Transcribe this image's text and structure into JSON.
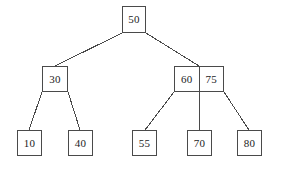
{
  "diagram": {
    "type": "tree-diagram",
    "background_color": "#ffffff",
    "line_color": "#4a4a4a",
    "text_color": "#1c1c1c",
    "canvas": {
      "width": 282,
      "height": 169
    },
    "nodes": [
      {
        "id": "root",
        "level": 0,
        "keys": [
          "50"
        ],
        "x": 122,
        "y": 6,
        "width": 24,
        "height": 27
      },
      {
        "id": "internal-left",
        "level": 1,
        "keys": [
          "30"
        ],
        "x": 42,
        "y": 66,
        "width": 26,
        "height": 26
      },
      {
        "id": "internal-right",
        "level": 1,
        "keys": [
          "60",
          "75"
        ],
        "x": 174,
        "y": 66,
        "width": 50,
        "height": 26
      },
      {
        "id": "leaf-10",
        "level": 2,
        "keys": [
          "10"
        ],
        "x": 17,
        "y": 130,
        "width": 25,
        "height": 26
      },
      {
        "id": "leaf-40",
        "level": 2,
        "keys": [
          "40"
        ],
        "x": 68,
        "y": 130,
        "width": 25,
        "height": 26
      },
      {
        "id": "leaf-55",
        "level": 2,
        "keys": [
          "55"
        ],
        "x": 132,
        "y": 130,
        "width": 25,
        "height": 26
      },
      {
        "id": "leaf-70",
        "level": 2,
        "keys": [
          "70"
        ],
        "x": 187,
        "y": 130,
        "width": 25,
        "height": 26
      },
      {
        "id": "leaf-80",
        "level": 2,
        "keys": [
          "80"
        ],
        "x": 237,
        "y": 130,
        "width": 25,
        "height": 26
      }
    ],
    "edges": [
      {
        "id": "root-to-left",
        "from": "root",
        "to": "internal-left",
        "x1": 122,
        "y1": 33,
        "x2": 55,
        "y2": 66
      },
      {
        "id": "root-to-right",
        "from": "root",
        "to": "internal-right",
        "x1": 146,
        "y1": 33,
        "x2": 199,
        "y2": 66
      },
      {
        "id": "left-to-10",
        "from": "internal-left",
        "to": "leaf-10",
        "x1": 42,
        "y1": 92,
        "x2": 29,
        "y2": 130
      },
      {
        "id": "left-to-40",
        "from": "internal-left",
        "to": "leaf-40",
        "x1": 68,
        "y1": 92,
        "x2": 80,
        "y2": 130
      },
      {
        "id": "right-to-55",
        "from": "internal-right",
        "to": "leaf-55",
        "x1": 174,
        "y1": 92,
        "x2": 145,
        "y2": 130
      },
      {
        "id": "right-to-70",
        "from": "internal-right",
        "to": "leaf-70",
        "x1": 199,
        "y1": 92,
        "x2": 199,
        "y2": 130
      },
      {
        "id": "right-to-80",
        "from": "internal-right",
        "to": "leaf-80",
        "x1": 224,
        "y1": 92,
        "x2": 249,
        "y2": 130
      }
    ]
  }
}
